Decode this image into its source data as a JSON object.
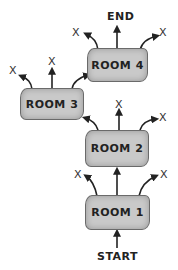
{
  "diagram": {
    "type": "flow",
    "start_label": "START",
    "end_label": "END",
    "rooms": [
      {
        "id": "room1",
        "label": "ROOM 1"
      },
      {
        "id": "room2",
        "label": "ROOM 2"
      },
      {
        "id": "room3",
        "label": "ROOM 3"
      },
      {
        "id": "room4",
        "label": "ROOM 4"
      }
    ],
    "dead_end_marker": "X",
    "edges": [
      {
        "from": "START",
        "to": "ROOM 1"
      },
      {
        "from": "ROOM 1",
        "to": "ROOM 2"
      },
      {
        "from": "ROOM 1",
        "to": "X"
      },
      {
        "from": "ROOM 1",
        "to": "X"
      },
      {
        "from": "ROOM 2",
        "to": "ROOM 3"
      },
      {
        "from": "ROOM 2",
        "to": "X"
      },
      {
        "from": "ROOM 2",
        "to": "X"
      },
      {
        "from": "ROOM 3",
        "to": "ROOM 4"
      },
      {
        "from": "ROOM 3",
        "to": "X"
      },
      {
        "from": "ROOM 3",
        "to": "X"
      },
      {
        "from": "ROOM 4",
        "to": "END"
      },
      {
        "from": "ROOM 4",
        "to": "X"
      },
      {
        "from": "ROOM 4",
        "to": "X"
      }
    ],
    "colors": {
      "box_fill": "#c9c9c9",
      "ink": "#222222"
    }
  }
}
